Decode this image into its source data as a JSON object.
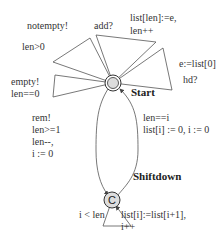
{
  "states": {
    "start": {
      "name": "Start",
      "initial": true
    },
    "shiftdown": {
      "name": "Shiftdown",
      "committed_symbol": "C"
    }
  },
  "edges": {
    "notempty": {
      "sync": "notempty!",
      "guard": "len>0"
    },
    "empty": {
      "sync": "empty!",
      "guard": "len==0"
    },
    "add": {
      "sync": "add?",
      "update1": "list[len]:=e,",
      "update2": "len++"
    },
    "hd": {
      "update": "e:=list[0]",
      "sync": "hd?"
    },
    "rem": {
      "sync": "rem!",
      "guard": "len>=1",
      "update1": "len--,",
      "update2": "i := 0"
    },
    "to_start": {
      "guard": "len==i",
      "update": "list[i] := 0, i := 0"
    },
    "shift": {
      "guard": "i < len",
      "update1": "list[i]:=list[i+1],",
      "update2": "i++"
    }
  }
}
